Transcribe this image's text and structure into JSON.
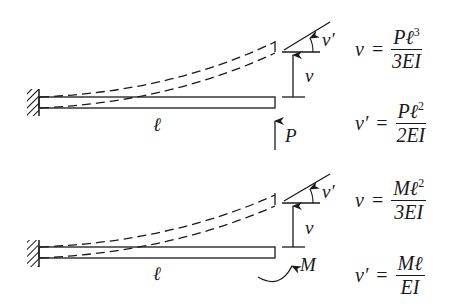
{
  "figure": {
    "panels": [
      {
        "name": "point-load",
        "beam_length_label": "ℓ",
        "deflection_label": "v",
        "slope_label": "v′",
        "load_label": "P",
        "equations": [
          {
            "lhs": "v",
            "num": "Pℓ",
            "num_exp": "3",
            "den": "3EI"
          },
          {
            "lhs": "v′",
            "num": "Pℓ",
            "num_exp": "2",
            "den": "2EI"
          }
        ]
      },
      {
        "name": "end-moment",
        "beam_length_label": "ℓ",
        "deflection_label": "v",
        "slope_label": "v′",
        "load_label": "M",
        "equations": [
          {
            "lhs": "v",
            "num": "Mℓ",
            "num_exp": "2",
            "den": "3EI"
          },
          {
            "lhs": "v′",
            "num": "Mℓ",
            "num_exp": "",
            "den": "EI"
          }
        ]
      }
    ],
    "equals_sign": "="
  }
}
